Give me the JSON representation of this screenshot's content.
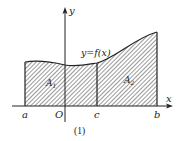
{
  "diagram": {
    "type": "area-under-curve",
    "curve_label": "y=f(x)",
    "axes": {
      "x_label": "x",
      "y_label": "y",
      "origin_label": "O"
    },
    "points": {
      "a": "a",
      "c": "c",
      "b": "b"
    },
    "regions": [
      {
        "name": "A1",
        "label": "A",
        "subscript": "1",
        "interval": "[a, c]"
      },
      {
        "name": "A2",
        "label": "A",
        "subscript": "2",
        "interval": "[c, b]"
      }
    ],
    "caption": "(1)",
    "colors": {
      "stroke": "#222222",
      "hatch": "#444444",
      "background": "#ffffff"
    }
  }
}
